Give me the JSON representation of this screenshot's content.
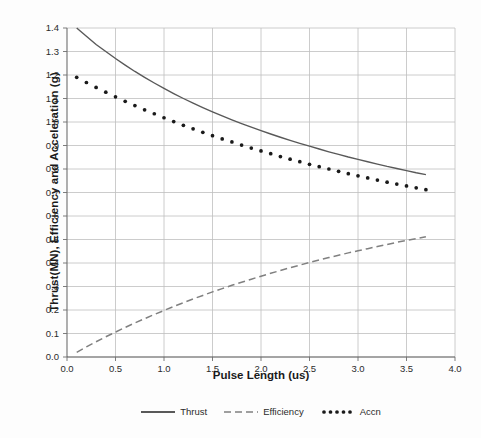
{
  "chart_data": {
    "type": "line",
    "title": "",
    "xlabel": "Pulse Length (us)",
    "ylabel": "Thrust(MN), Efficiency and Acceleration (g)",
    "xlim": [
      0.0,
      4.0
    ],
    "ylim": [
      0.0,
      1.4
    ],
    "xticks": [
      "0.0",
      "0.5",
      "1.0",
      "1.5",
      "2.0",
      "2.5",
      "3.0",
      "3.5",
      "4.0"
    ],
    "yticks": [
      "0.0",
      "0.1",
      "0.2",
      "0.3",
      "0.4",
      "0.5",
      "0.6",
      "0.7",
      "0.8",
      "0.9",
      "1.0",
      "1.1",
      "1.2",
      "1.3",
      "1.4"
    ],
    "grid": true,
    "legend_position": "bottom",
    "x": [
      0.1,
      0.2,
      0.3,
      0.4,
      0.5,
      0.6,
      0.7,
      0.8,
      0.9,
      1.0,
      1.1,
      1.2,
      1.3,
      1.4,
      1.5,
      1.6,
      1.7,
      1.8,
      1.9,
      2.0,
      2.1,
      2.2,
      2.3,
      2.4,
      2.5,
      2.6,
      2.7,
      2.8,
      2.9,
      3.0,
      3.1,
      3.2,
      3.3,
      3.4,
      3.5,
      3.6,
      3.7
    ],
    "series": [
      {
        "name": "Thrust",
        "style": "solid",
        "color": "#595959",
        "values": [
          1.4,
          1.365,
          1.33,
          1.3,
          1.27,
          1.242,
          1.215,
          1.19,
          1.166,
          1.143,
          1.121,
          1.1,
          1.08,
          1.061,
          1.043,
          1.026,
          1.009,
          0.993,
          0.978,
          0.963,
          0.949,
          0.935,
          0.922,
          0.909,
          0.897,
          0.885,
          0.873,
          0.862,
          0.851,
          0.841,
          0.831,
          0.821,
          0.811,
          0.802,
          0.793,
          0.784,
          0.776
        ]
      },
      {
        "name": "Efficiency",
        "style": "dashed",
        "color": "#808080",
        "values": [
          0.02,
          0.043,
          0.065,
          0.086,
          0.106,
          0.126,
          0.145,
          0.163,
          0.181,
          0.198,
          0.215,
          0.231,
          0.247,
          0.262,
          0.277,
          0.291,
          0.305,
          0.318,
          0.331,
          0.344,
          0.356,
          0.368,
          0.38,
          0.391,
          0.402,
          0.413,
          0.423,
          0.433,
          0.443,
          0.452,
          0.461,
          0.47,
          0.479,
          0.488,
          0.496,
          0.504,
          0.512
        ]
      },
      {
        "name": "Accn",
        "style": "dotted",
        "color": "#1a1a1a",
        "values": [
          1.19,
          1.168,
          1.147,
          1.127,
          1.107,
          1.088,
          1.07,
          1.052,
          1.035,
          1.018,
          1.002,
          0.986,
          0.971,
          0.956,
          0.942,
          0.928,
          0.915,
          0.902,
          0.889,
          0.877,
          0.865,
          0.853,
          0.842,
          0.831,
          0.82,
          0.81,
          0.8,
          0.79,
          0.78,
          0.771,
          0.762,
          0.753,
          0.744,
          0.736,
          0.728,
          0.72,
          0.712
        ]
      }
    ]
  },
  "legend": {
    "items": [
      {
        "label": "Thrust"
      },
      {
        "label": "Efficiency"
      },
      {
        "label": "Accn"
      }
    ]
  },
  "axes": {
    "x_title": "Pulse Length (us)",
    "y_title": "Thrust(MN), Efficiency and Acceleration (g)"
  },
  "colors": {
    "thrust": "#595959",
    "efficiency": "#808080",
    "accn": "#1a1a1a",
    "grid": "#bfbfbf",
    "axis": "#808080",
    "background": "#fdfdfd"
  }
}
